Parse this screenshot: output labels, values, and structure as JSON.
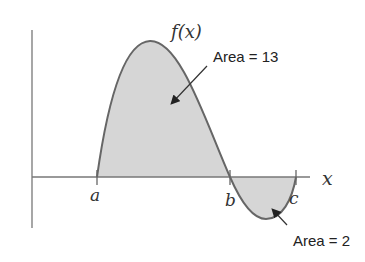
{
  "diagram": {
    "function_label": "f(x)",
    "x_axis_label": "x",
    "points": [
      {
        "name": "a",
        "label": "a"
      },
      {
        "name": "b",
        "label": "b"
      },
      {
        "name": "c",
        "label": "c"
      }
    ],
    "annotations": [
      {
        "name": "area-positive",
        "label": "Area = 13"
      },
      {
        "name": "area-negative",
        "label": "Area = 2"
      }
    ],
    "colors": {
      "fill": "#d6d6d6",
      "curve": "#666666",
      "axis": "#777777",
      "arrow": "#333333"
    }
  }
}
